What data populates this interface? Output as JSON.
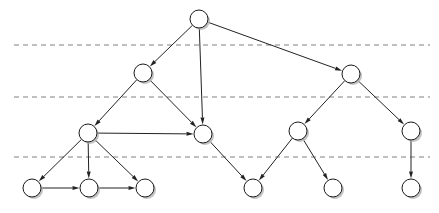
{
  "diagram": {
    "type": "node-link-diagram",
    "width": 439,
    "height": 213,
    "background_color": "#ffffff",
    "node_style": {
      "shape": "circle",
      "radius": 9,
      "fill_color": "#ffffff",
      "stroke_color": "#1a1a1a",
      "stroke_width": 1,
      "shadow_color": "#b8b8b8",
      "shadow_offset_x": 2,
      "shadow_offset_y": 2,
      "label": ""
    },
    "edge_style": {
      "stroke_color": "#222222",
      "stroke_width": 1,
      "directed": true,
      "arrow_length": 7,
      "arrow_width": 4
    },
    "layer_line_style": {
      "stroke_color": "#808080",
      "stroke_width": 1,
      "dash_pattern": "5 4",
      "x_start": 14,
      "x_end": 430
    },
    "layer_lines": [
      {
        "name": "layer-separator-1",
        "y": 45
      },
      {
        "name": "layer-separator-2",
        "y": 97
      },
      {
        "name": "layer-separator-3",
        "y": 157
      }
    ],
    "nodes": [
      {
        "id": "n1",
        "name": "node-root",
        "cx": 199,
        "cy": 19,
        "layer": 0,
        "label": ""
      },
      {
        "id": "n2",
        "name": "node-left-mid",
        "cx": 143,
        "cy": 73,
        "layer": 1,
        "label": ""
      },
      {
        "id": "n3",
        "name": "node-right-mid",
        "cx": 351,
        "cy": 74,
        "layer": 1,
        "label": ""
      },
      {
        "id": "n4",
        "name": "node-left-hub",
        "cx": 88,
        "cy": 133,
        "layer": 2,
        "label": ""
      },
      {
        "id": "n5",
        "name": "node-center-sink",
        "cx": 203,
        "cy": 134,
        "layer": 2,
        "label": ""
      },
      {
        "id": "n6",
        "name": "node-right-fork",
        "cx": 298,
        "cy": 131,
        "layer": 2,
        "label": ""
      },
      {
        "id": "n7",
        "name": "node-far-right",
        "cx": 411,
        "cy": 131,
        "layer": 2,
        "label": ""
      },
      {
        "id": "n8",
        "name": "node-leaf-a",
        "cx": 32,
        "cy": 188,
        "layer": 3,
        "label": ""
      },
      {
        "id": "n9",
        "name": "node-leaf-b",
        "cx": 89,
        "cy": 188,
        "layer": 3,
        "label": ""
      },
      {
        "id": "n10",
        "name": "node-leaf-c",
        "cx": 145,
        "cy": 188,
        "layer": 3,
        "label": ""
      },
      {
        "id": "n11",
        "name": "node-leaf-d",
        "cx": 253,
        "cy": 188,
        "layer": 3,
        "label": ""
      },
      {
        "id": "n12",
        "name": "node-leaf-e",
        "cx": 333,
        "cy": 188,
        "layer": 3,
        "label": ""
      },
      {
        "id": "n13",
        "name": "node-leaf-f",
        "cx": 411,
        "cy": 188,
        "layer": 3,
        "label": ""
      }
    ],
    "edges": [
      {
        "name": "edge-root-to-left-mid",
        "from": "n1",
        "to": "n2"
      },
      {
        "name": "edge-root-to-right-mid",
        "from": "n1",
        "to": "n3"
      },
      {
        "name": "edge-root-to-center-sink",
        "from": "n1",
        "to": "n5"
      },
      {
        "name": "edge-left-mid-to-left-hub",
        "from": "n2",
        "to": "n4"
      },
      {
        "name": "edge-left-mid-to-center",
        "from": "n2",
        "to": "n5"
      },
      {
        "name": "edge-right-mid-to-fork",
        "from": "n3",
        "to": "n6"
      },
      {
        "name": "edge-right-mid-to-far-right",
        "from": "n3",
        "to": "n7"
      },
      {
        "name": "edge-left-hub-to-center",
        "from": "n4",
        "to": "n5"
      },
      {
        "name": "edge-left-hub-to-leaf-a",
        "from": "n4",
        "to": "n8"
      },
      {
        "name": "edge-left-hub-to-leaf-b",
        "from": "n4",
        "to": "n9"
      },
      {
        "name": "edge-left-hub-to-leaf-c",
        "from": "n4",
        "to": "n10"
      },
      {
        "name": "edge-center-to-leaf-d",
        "from": "n5",
        "to": "n11"
      },
      {
        "name": "edge-fork-to-leaf-d",
        "from": "n6",
        "to": "n11"
      },
      {
        "name": "edge-fork-to-leaf-e",
        "from": "n6",
        "to": "n12"
      },
      {
        "name": "edge-far-right-to-leaf-f",
        "from": "n7",
        "to": "n13"
      },
      {
        "name": "edge-leaf-a-to-leaf-b",
        "from": "n8",
        "to": "n9"
      },
      {
        "name": "edge-leaf-b-to-leaf-c",
        "from": "n9",
        "to": "n10"
      }
    ]
  }
}
